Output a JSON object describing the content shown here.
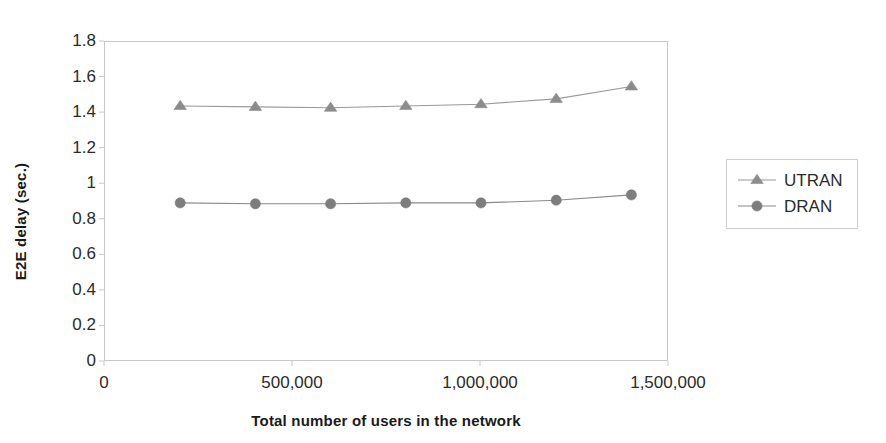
{
  "chart_data": {
    "type": "line",
    "title": "",
    "xlabel": "Total number of users in the network",
    "ylabel": "E2E delay (sec.)",
    "xlim": [
      0,
      1500000
    ],
    "ylim": [
      0,
      1.8
    ],
    "grid": false,
    "legend_position": "right",
    "x": [
      200000,
      400000,
      600000,
      800000,
      1000000,
      1200000,
      1400000
    ],
    "xticks": [
      0,
      500000,
      1000000,
      1500000
    ],
    "xtick_labels": [
      "0",
      "500,000",
      "1,000,000",
      "1,500,000"
    ],
    "yticks": [
      0,
      0.2,
      0.4,
      0.6,
      0.8,
      1,
      1.2,
      1.4,
      1.6,
      1.8
    ],
    "ytick_labels": [
      "0",
      "0.2",
      "0.4",
      "0.6",
      "0.8",
      "1",
      "1.2",
      "1.4",
      "1.6",
      "1.8"
    ],
    "series": [
      {
        "name": "UTRAN",
        "marker": "triangle",
        "color": "#8c8c8c",
        "line_color": "#9a9a9a",
        "values": [
          1.44,
          1.435,
          1.43,
          1.44,
          1.45,
          1.48,
          1.55
        ]
      },
      {
        "name": "DRAN",
        "marker": "circle",
        "color": "#7d7d7d",
        "line_color": "#8a8a8a",
        "values": [
          0.895,
          0.89,
          0.89,
          0.895,
          0.895,
          0.91,
          0.94
        ]
      }
    ]
  },
  "legend": {
    "items": [
      {
        "label": "UTRAN",
        "marker": "triangle-marker-icon"
      },
      {
        "label": "DRAN",
        "marker": "circle-marker-icon"
      }
    ]
  },
  "colors": {
    "axis": "#c9c9c9",
    "text": "#2b2b2b",
    "title_text": "#1a1a1a",
    "series_utran": "#8c8c8c",
    "series_dran": "#7d7d7d",
    "background": "#ffffff"
  }
}
